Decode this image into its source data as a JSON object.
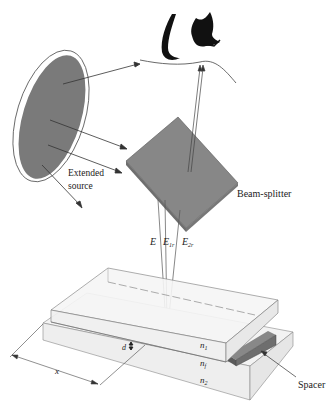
{
  "figure": {
    "labels": {
      "source_line1": "Extended",
      "source_line2": "source",
      "beam_splitter": "Beam-splitter",
      "E": "E",
      "E1r": "E",
      "E1r_sub": "1r",
      "E2r": "E",
      "E2r_sub": "2r",
      "n1": "n",
      "n1_sub": "1",
      "nf": "n",
      "nf_sub": "f",
      "n2": "n",
      "n2_sub": "2",
      "d": "d",
      "x": "x",
      "spacer": "Spacer"
    },
    "colors": {
      "source_fill": "#7a7a7a",
      "splitter_fill": "#858585",
      "spacer_fill": "#6e6e6e",
      "plate_fill": "#f2f2f2",
      "line": "#333333"
    }
  }
}
